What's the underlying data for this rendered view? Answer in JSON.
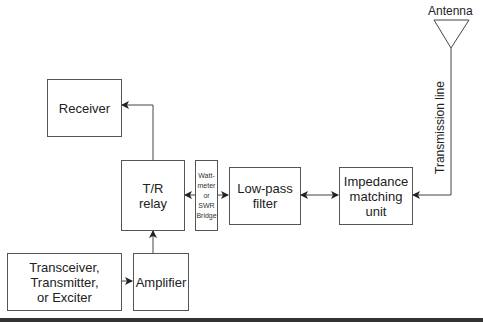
{
  "diagram": {
    "type": "block-diagram",
    "blocks": {
      "receiver": "Receiver",
      "tr_relay": "T/R\nrelay",
      "wattmeter": "Watt-\nmeter\nor\nSWR\nBridge",
      "low_pass_filter": "Low-pass\nfilter",
      "impedance_matching": "Impedance\nmatching\nunit",
      "transceiver": "Transceiver,\nTransmitter,\nor Exciter",
      "amplifier": "Amplifier"
    },
    "labels": {
      "antenna": "Antenna",
      "transmission_line": "Transmission line"
    },
    "connections": [
      {
        "from": "transceiver",
        "to": "amplifier",
        "direction": "forward"
      },
      {
        "from": "amplifier",
        "to": "tr_relay",
        "direction": "forward"
      },
      {
        "from": "tr_relay",
        "to": "receiver",
        "direction": "forward"
      },
      {
        "from": "tr_relay",
        "to": "wattmeter",
        "direction": "bidirectional"
      },
      {
        "from": "wattmeter",
        "to": "low_pass_filter",
        "direction": "bidirectional"
      },
      {
        "from": "low_pass_filter",
        "to": "impedance_matching",
        "direction": "bidirectional"
      },
      {
        "from": "antenna",
        "to": "impedance_matching",
        "direction": "forward",
        "via": "transmission_line"
      }
    ],
    "colors": {
      "stroke": "#555555",
      "text": "#222222",
      "bottom_bar": "#333333"
    }
  }
}
